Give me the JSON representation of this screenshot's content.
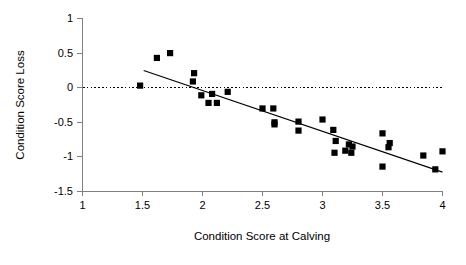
{
  "chart_data": {
    "type": "scatter",
    "title": "",
    "xlabel": "Condition Score at Calving",
    "ylabel": "Condition Score Loss",
    "xlim": [
      1,
      4
    ],
    "ylim": [
      -1.5,
      1
    ],
    "xticks": [
      1,
      1.5,
      2,
      2.5,
      3,
      3.5,
      4
    ],
    "yticks": [
      1,
      0.5,
      0,
      -0.5,
      -1,
      -1.5
    ],
    "xtick_labels": [
      "1",
      "1.5",
      "2",
      "2.5",
      "3",
      "3.5",
      "4"
    ],
    "ytick_labels": [
      "1",
      "0.5",
      "0",
      "-0.5",
      "-1",
      "-1.5"
    ],
    "grid": false,
    "legend": null,
    "marker": "square",
    "marker_color": "#000000",
    "points": [
      {
        "x": 1.48,
        "y": 0.03
      },
      {
        "x": 1.62,
        "y": 0.43
      },
      {
        "x": 1.73,
        "y": 0.5
      },
      {
        "x": 1.93,
        "y": 0.21
      },
      {
        "x": 1.92,
        "y": 0.09
      },
      {
        "x": 1.99,
        "y": -0.11
      },
      {
        "x": 2.05,
        "y": -0.22
      },
      {
        "x": 2.12,
        "y": -0.22
      },
      {
        "x": 2.08,
        "y": -0.09
      },
      {
        "x": 2.21,
        "y": -0.06
      },
      {
        "x": 2.5,
        "y": -0.3
      },
      {
        "x": 2.59,
        "y": -0.3
      },
      {
        "x": 2.6,
        "y": -0.5
      },
      {
        "x": 2.6,
        "y": -0.53
      },
      {
        "x": 2.8,
        "y": -0.49
      },
      {
        "x": 2.8,
        "y": -0.62
      },
      {
        "x": 3.0,
        "y": -0.46
      },
      {
        "x": 3.09,
        "y": -0.61
      },
      {
        "x": 3.11,
        "y": -0.77
      },
      {
        "x": 3.1,
        "y": -0.94
      },
      {
        "x": 3.19,
        "y": -0.91
      },
      {
        "x": 3.22,
        "y": -0.82
      },
      {
        "x": 3.24,
        "y": -0.94
      },
      {
        "x": 3.25,
        "y": -0.85
      },
      {
        "x": 3.5,
        "y": -0.66
      },
      {
        "x": 3.56,
        "y": -0.8
      },
      {
        "x": 3.5,
        "y": -1.14
      },
      {
        "x": 3.55,
        "y": -0.86
      },
      {
        "x": 3.84,
        "y": -0.98
      },
      {
        "x": 4.0,
        "y": -0.92
      },
      {
        "x": 3.94,
        "y": -1.18
      }
    ],
    "trend_line": {
      "x0": 1.51,
      "y0": 0.25,
      "x1": 4.0,
      "y1": -1.22,
      "style": "solid",
      "color": "#000000"
    },
    "reference_line": {
      "y": 0,
      "style": "dotted",
      "color": "#000000"
    }
  }
}
